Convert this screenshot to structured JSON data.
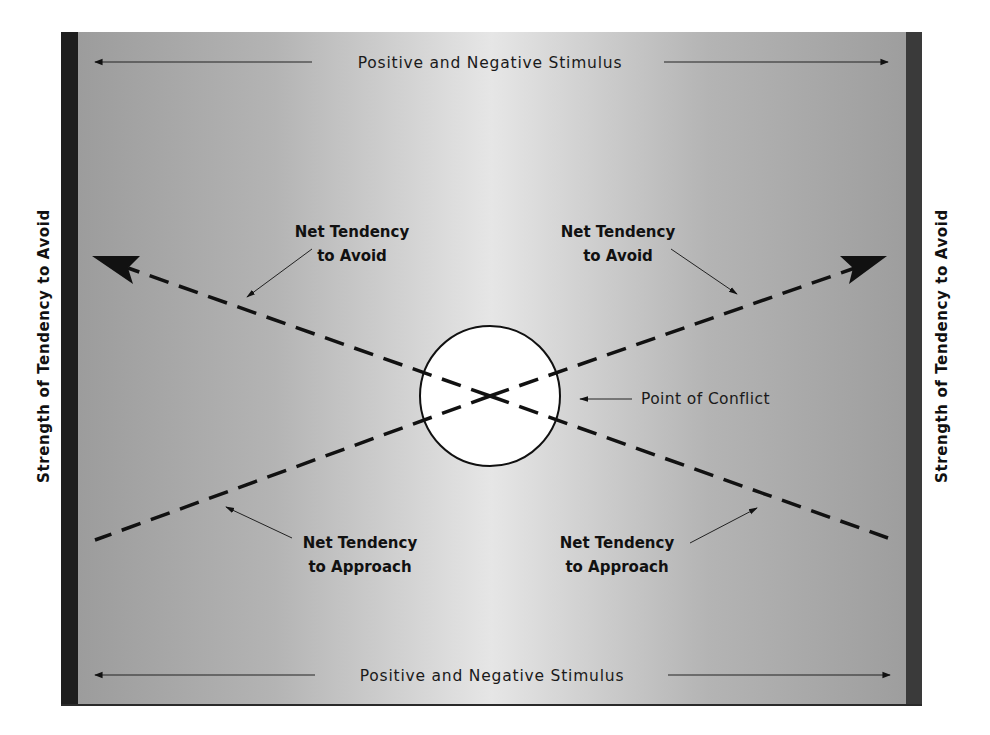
{
  "diagram": {
    "top_axis_label": "Positive and Negative Stimulus",
    "bottom_axis_label": "Positive and Negative Stimulus",
    "left_axis_label": "Strength of Tendency to Avoid",
    "right_axis_label": "Strength of Tendency to Avoid",
    "center_label": "Point of Conflict",
    "annotations": {
      "top_left": {
        "line1": "Net Tendency",
        "line2": "to Avoid"
      },
      "top_right": {
        "line1": "Net Tendency",
        "line2": "to Avoid"
      },
      "bottom_left": {
        "line1": "Net Tendency",
        "line2": "to Approach"
      },
      "bottom_right": {
        "line1": "Net Tendency",
        "line2": "to Approach"
      }
    },
    "lines": [
      {
        "name": "avoid-left",
        "from": [
          490,
          396
        ],
        "to": [
          95,
          257
        ],
        "style": "dashed",
        "arrowhead": "end"
      },
      {
        "name": "avoid-right",
        "from": [
          490,
          396
        ],
        "to": [
          885,
          257
        ],
        "style": "dashed",
        "arrowhead": "end"
      },
      {
        "name": "approach-left",
        "from": [
          490,
          396
        ],
        "to": [
          95,
          540
        ],
        "style": "dashed",
        "arrowhead": "none"
      },
      {
        "name": "approach-right",
        "from": [
          490,
          396
        ],
        "to": [
          888,
          538
        ],
        "style": "dashed",
        "arrowhead": "none"
      }
    ],
    "colors": {
      "panel_center": "#e6e6e6",
      "panel_edge": "#9a9a9a",
      "left_bar": "#1e1e1e",
      "right_bar": "#3a3a3a",
      "line": "#111111",
      "circle_fill": "#ffffff"
    }
  }
}
